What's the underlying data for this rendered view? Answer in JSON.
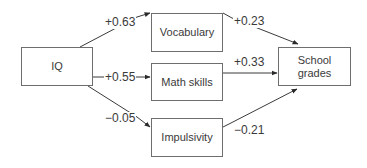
{
  "diagram": {
    "type": "path-diagram",
    "nodes": {
      "iq": "IQ",
      "vocabulary": "Vocabulary",
      "math": "Math skills",
      "impulsivity": "Impulsivity",
      "school_line1": "School",
      "school_line2": "grades"
    },
    "edges": [
      {
        "from": "IQ",
        "to": "Vocabulary",
        "coef": "+0.63"
      },
      {
        "from": "IQ",
        "to": "Math skills",
        "coef": "+0.55"
      },
      {
        "from": "IQ",
        "to": "Impulsivity",
        "coef": "−0.05"
      },
      {
        "from": "Vocabulary",
        "to": "School grades",
        "coef": "+0.23"
      },
      {
        "from": "Math skills",
        "to": "School grades",
        "coef": "+0.33"
      },
      {
        "from": "Impulsivity",
        "to": "School grades",
        "coef": "−0.21"
      }
    ],
    "colors": {
      "line": "#3a3a3a",
      "border": "#6e6e6e",
      "text": "#3a3a3a"
    }
  }
}
